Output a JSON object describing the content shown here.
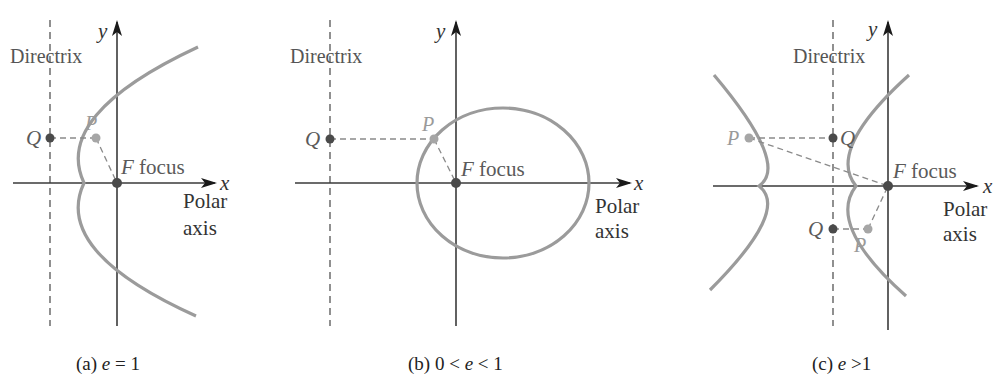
{
  "figure": {
    "panels": [
      {
        "id": "a",
        "caption_prefix": "(a) ",
        "caption_var": "e",
        "caption_rel": " = 1",
        "conic": "parabola",
        "labels": {
          "directrix": "Directrix",
          "y": "y",
          "x": "x",
          "F": "F",
          "focus": " focus",
          "polar1": "Polar",
          "polar2": "axis",
          "Q": "Q",
          "P": "P"
        }
      },
      {
        "id": "b",
        "caption_prefix": "(b) 0 < ",
        "caption_var": "e",
        "caption_rel": " < 1",
        "conic": "ellipse",
        "labels": {
          "directrix": "Directrix",
          "y": "y",
          "x": "x",
          "F": "F",
          "focus": " focus",
          "polar1": "Polar",
          "polar2": "axis",
          "Q": "Q",
          "P": "P"
        }
      },
      {
        "id": "c",
        "caption_prefix": "(c) ",
        "caption_var": "e",
        "caption_rel": " >1",
        "conic": "hyperbola",
        "labels": {
          "directrix": "Directrix",
          "y": "y",
          "x": "x",
          "F": "F",
          "focus": " focus",
          "polar1": "Polar",
          "polar2": "axis",
          "Q1": "Q",
          "P1": "P",
          "Q2": "Q",
          "P2": "P"
        }
      }
    ],
    "colors": {
      "curve": "#9b9b9b",
      "axis": "#3a3a3a",
      "point_dark": "#4a4a4a",
      "point_light": "#a6a6a6",
      "background": "#ffffff"
    }
  }
}
